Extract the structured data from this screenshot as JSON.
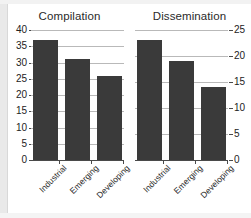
{
  "chart_data": [
    {
      "type": "bar",
      "title": "Compilation",
      "categories": [
        "Industrial",
        "Emerging",
        "Developing"
      ],
      "values": [
        37,
        31,
        26
      ],
      "xlabel": "",
      "ylabel": "",
      "ylim": [
        0,
        40
      ],
      "yticks": [
        0,
        5,
        10,
        15,
        20,
        25,
        30,
        35,
        40
      ],
      "yaxis_position": "left",
      "grid": true,
      "legend": "none",
      "bar_color": "#3a3a3a",
      "gridline_color": "#b9b9b9"
    },
    {
      "type": "bar",
      "title": "Dissemination",
      "categories": [
        "Industrial",
        "Emerging",
        "Developing"
      ],
      "values": [
        23,
        19,
        14
      ],
      "xlabel": "",
      "ylabel": "",
      "ylim": [
        0,
        25
      ],
      "yticks": [
        0,
        5,
        10,
        15,
        20,
        25
      ],
      "yaxis_position": "right",
      "grid": true,
      "legend": "none",
      "bar_color": "#3a3a3a",
      "gridline_color": "#b9b9b9"
    }
  ]
}
